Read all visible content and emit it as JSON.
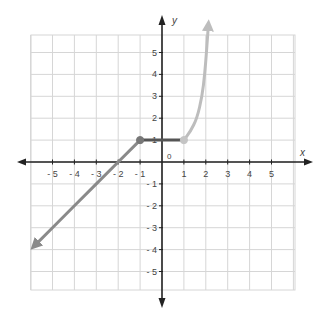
{
  "chart_data": {
    "type": "line",
    "title": "",
    "xlabel": "x",
    "ylabel": "y",
    "origin_label": "0",
    "xlim": [
      -6,
      6
    ],
    "ylim": [
      -6,
      6
    ],
    "grid": true,
    "x_ticks": [
      "-5",
      "-4",
      "-3",
      "-2",
      "-1",
      "1",
      "2",
      "3",
      "4",
      "5"
    ],
    "y_ticks": [
      "5",
      "4",
      "3",
      "2",
      "1",
      "-1",
      "-2",
      "-3",
      "-4",
      "-5"
    ],
    "series": [
      {
        "name": "left-ray",
        "description": "y = x + 2 for x <= -1",
        "color": "#8a8a8a",
        "points": [
          [
            -1,
            1
          ],
          [
            -2,
            0
          ],
          [
            -3,
            -1
          ],
          [
            -4,
            -2
          ],
          [
            -5,
            -3
          ],
          [
            -5.85,
            -3.85
          ]
        ],
        "arrow_end": true
      },
      {
        "name": "middle-segment",
        "description": "y = 1 for -1 <= x <= 1",
        "color": "#555555",
        "points": [
          [
            -1,
            1
          ],
          [
            1,
            1
          ]
        ]
      },
      {
        "name": "right-curve",
        "description": "steep increasing curve for x >= 1",
        "color": "#bdbdbd",
        "points": [
          [
            1,
            1
          ],
          [
            1.3,
            1.4
          ],
          [
            1.6,
            2
          ],
          [
            1.83,
            3
          ],
          [
            1.95,
            4
          ],
          [
            2.03,
            5
          ],
          [
            2.12,
            6.3
          ]
        ],
        "arrow_end": true
      }
    ],
    "markers": [
      {
        "x": -1,
        "y": 1,
        "color": "#777777",
        "filled": true
      },
      {
        "x": 1,
        "y": 1,
        "color": "#c4c4c4",
        "filled": true
      }
    ]
  }
}
